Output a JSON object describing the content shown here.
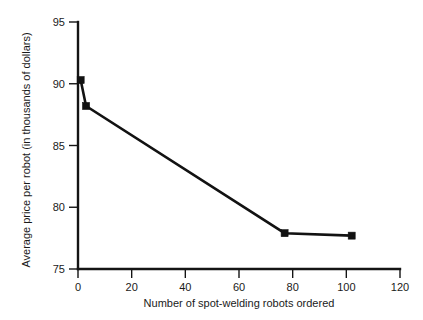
{
  "chart_data": {
    "type": "line",
    "title": "",
    "xlabel": "Number of spot-welding robots ordered",
    "ylabel": "Average price per robot (in thousands of dollars)",
    "xlim": [
      0,
      120
    ],
    "ylim": [
      75,
      95
    ],
    "xticks": [
      0,
      20,
      40,
      60,
      80,
      100,
      120
    ],
    "yticks": [
      75,
      80,
      85,
      90,
      95
    ],
    "xtick_labels": [
      "0",
      "20",
      "40",
      "60",
      "80",
      "100",
      "120"
    ],
    "ytick_labels": [
      "75",
      "80",
      "85",
      "90",
      "95"
    ],
    "grid": false,
    "legend": false,
    "legend_position": "none",
    "marker": "square",
    "line_color": "#121212",
    "marker_color": "#121212",
    "background_color": "#ffffff",
    "x": [
      1,
      3,
      77,
      102
    ],
    "values": [
      90.3,
      88.2,
      77.9,
      77.7
    ],
    "points": [
      {
        "x": 1,
        "y": 90.3
      },
      {
        "x": 3,
        "y": 88.2
      },
      {
        "x": 77,
        "y": 77.9
      },
      {
        "x": 102,
        "y": 77.7
      }
    ],
    "series": [
      {
        "name": "Average price per robot",
        "x": [
          1,
          3,
          77,
          102
        ],
        "values": [
          90.3,
          88.2,
          77.9,
          77.7
        ]
      }
    ]
  }
}
